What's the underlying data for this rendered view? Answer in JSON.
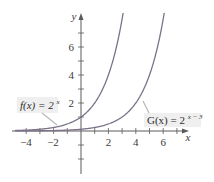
{
  "chart_data": {
    "type": "line",
    "title": "",
    "xlabel": "x",
    "ylabel": "y",
    "xlim": [
      -5,
      7.5
    ],
    "ylim": [
      -3,
      8.4
    ],
    "grid": false,
    "x_ticks": [
      -4,
      -2,
      2,
      4,
      6
    ],
    "y_ticks": [
      2,
      4,
      6
    ],
    "series": [
      {
        "name": "f(x) = 2^x",
        "label_main": "f(x) = 2",
        "label_exp": "x",
        "formula": "2^x",
        "x": [
          -4,
          -3,
          -2,
          -1,
          0,
          1,
          2,
          3
        ],
        "values": [
          0.0625,
          0.125,
          0.25,
          0.5,
          1,
          2,
          4,
          8
        ]
      },
      {
        "name": "G(x) = 2^(x-3)",
        "label_main": "G(x) = 2",
        "label_exp": "x − 3",
        "formula": "2^(x-3)",
        "x": [
          -1,
          0,
          1,
          2,
          3,
          4,
          5,
          6
        ],
        "values": [
          0.0625,
          0.125,
          0.25,
          0.5,
          1,
          2,
          4,
          8
        ]
      }
    ]
  },
  "axes": {
    "x_name": "x",
    "y_name": "y",
    "x_tick_labels": [
      "−4",
      "−2",
      "2",
      "4",
      "6"
    ],
    "y_tick_labels": [
      "2",
      "4",
      "6"
    ]
  },
  "colors": {
    "curve": "#7b7288",
    "axis": "#5a5a5a",
    "label_box": "#efefef",
    "leader": "#b8b8b8"
  }
}
